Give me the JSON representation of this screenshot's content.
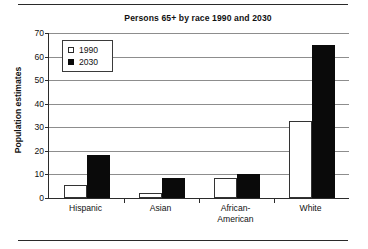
{
  "figure": {
    "has_top_rule": true,
    "has_bottom_rule": true,
    "rule_color": "#2a2a2a"
  },
  "chart_data": {
    "type": "bar",
    "title": "Persons 65+ by race 1990 and 2030",
    "xlabel": "",
    "ylabel": "Population estimates",
    "categories": [
      "Hispanic",
      "Asian",
      "African-American",
      "White"
    ],
    "category_lines": [
      [
        "Hispanic"
      ],
      [
        "Asian"
      ],
      [
        "African-",
        "American"
      ],
      [
        "White"
      ]
    ],
    "series": [
      {
        "name": "1990",
        "values": [
          5.5,
          2.2,
          8.5,
          32.5
        ],
        "color": "#ffffff",
        "edge_color": "#333333"
      },
      {
        "name": "2030",
        "values": [
          18.2,
          8.5,
          10.0,
          65.0
        ],
        "color": "#0a0a0a",
        "edge_color": "#0a0a0a"
      }
    ],
    "ylim": [
      0,
      70
    ],
    "yticks": [
      0,
      10,
      20,
      30,
      40,
      50,
      60,
      70
    ],
    "ytick_labels": [
      "0",
      "10",
      "20",
      "30",
      "40",
      "50",
      "60",
      "70"
    ],
    "grid": true,
    "grid_axis": "y",
    "grid_color": "#8d8d8d",
    "legend_position": "upper left",
    "legend_entries": [
      "1990",
      "2030"
    ],
    "axis_color": "#2b2b2b"
  }
}
